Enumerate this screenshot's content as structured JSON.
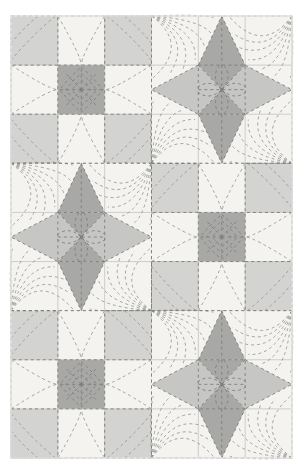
{
  "artwork": {
    "title": "Patchwork Quilt Sampler",
    "medium": "quilt-photograph",
    "canvas": {
      "width": 304,
      "height": 473,
      "background": "#ffffff"
    },
    "quilt_area": {
      "x": 11,
      "y": 16,
      "width": 281,
      "height": 442
    }
  },
  "palette": {
    "background": "#ffffff",
    "cream": "#f4f3f0",
    "off_white": "#efeeea",
    "light_gray": "#d3d3d1",
    "mid_gray": "#c6c6c4",
    "dark_gray": "#a8a8a6",
    "deep_gray": "#9c9c9a",
    "stitch": "#7d7d7b",
    "seam_line": "#bdbdbb",
    "quilt_line": "#8f8f8d",
    "edge_shadow": "#e3e2df"
  },
  "grid": {
    "columns": 2,
    "rows": 3,
    "block_width": 140.5,
    "block_height": 147.3,
    "layout": [
      [
        "nine-patch",
        "star"
      ],
      [
        "star",
        "nine-patch"
      ],
      [
        "nine-patch",
        "star"
      ]
    ]
  },
  "blocks": [
    {
      "id": "block-r1c1",
      "type": "nine-patch",
      "row": 1,
      "column": 1,
      "label": "Nine Patch Block",
      "center_color": "#a8a8a6",
      "corner_color": "#d3d3d1",
      "edge_color": "#f4f3f0",
      "quilting": "concentric-diamond"
    },
    {
      "id": "block-r1c2",
      "type": "star",
      "row": 1,
      "column": 2,
      "label": "Eight Point Star Block",
      "point_vertical_color": "#a8a8a6",
      "point_horizontal_color": "#c6c6c4",
      "center_triangle_colors": [
        "#a8a8a6",
        "#c6c6c4",
        "#a8a8a6",
        "#c6c6c4"
      ],
      "background_color": "#f4f3f0",
      "quilting": "radiating-feather"
    },
    {
      "id": "block-r2c1",
      "type": "star",
      "row": 2,
      "column": 1,
      "label": "Eight Point Star Block",
      "point_vertical_color": "#a8a8a6",
      "point_horizontal_color": "#c6c6c4",
      "center_triangle_colors": [
        "#a8a8a6",
        "#c6c6c4",
        "#a8a8a6",
        "#c6c6c4"
      ],
      "background_color": "#f4f3f0",
      "quilting": "radiating-feather"
    },
    {
      "id": "block-r2c2",
      "type": "nine-patch",
      "row": 2,
      "column": 2,
      "label": "Nine Patch Block",
      "center_color": "#a8a8a6",
      "corner_color": "#d3d3d1",
      "edge_color": "#f4f3f0",
      "quilting": "concentric-diamond"
    },
    {
      "id": "block-r3c1",
      "type": "nine-patch",
      "row": 3,
      "column": 1,
      "label": "Nine Patch Block",
      "center_color": "#a8a8a6",
      "corner_color": "#d3d3d1",
      "edge_color": "#f4f3f0",
      "quilting": "concentric-diamond"
    },
    {
      "id": "block-r3c2",
      "type": "star",
      "row": 3,
      "column": 2,
      "label": "Eight Point Star Block",
      "point_vertical_color": "#a8a8a6",
      "point_horizontal_color": "#c6c6c4",
      "center_triangle_colors": [
        "#a8a8a6",
        "#c6c6c4",
        "#a8a8a6",
        "#c6c6c4"
      ],
      "background_color": "#f4f3f0",
      "quilting": "radiating-feather"
    }
  ],
  "stitching": {
    "dash_pattern": "3 3",
    "stroke_width": 0.9,
    "color": "#7d7d7b",
    "quilt_arc_color": "#8f8f8d",
    "quilt_arc_width": 0.8,
    "seam_color": "#bdbdbb",
    "seam_width": 0.7
  }
}
